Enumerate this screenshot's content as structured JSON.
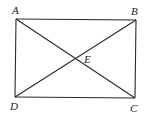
{
  "diagram": {
    "type": "geometry",
    "shape": "rectangle",
    "points": {
      "A": {
        "label": "A",
        "x": 16,
        "y": 19
      },
      "B": {
        "label": "B",
        "x": 136,
        "y": 20
      },
      "C": {
        "label": "C",
        "x": 135,
        "y": 98
      },
      "D": {
        "label": "D",
        "x": 15,
        "y": 97
      },
      "E": {
        "label": "E",
        "x": 76,
        "y": 59
      }
    },
    "segments": [
      {
        "from": "A",
        "to": "B"
      },
      {
        "from": "B",
        "to": "C"
      },
      {
        "from": "C",
        "to": "D"
      },
      {
        "from": "D",
        "to": "A"
      },
      {
        "from": "A",
        "to": "C"
      },
      {
        "from": "B",
        "to": "D"
      }
    ],
    "labels": {
      "A": "A",
      "B": "B",
      "C": "C",
      "D": "D",
      "E": "E"
    },
    "stroke_color": "#2a2a2a"
  }
}
